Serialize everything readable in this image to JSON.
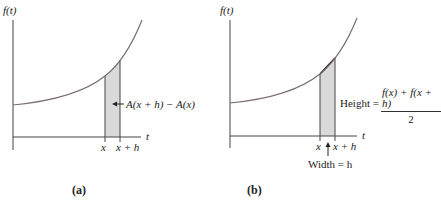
{
  "panels": {
    "a": {
      "y_axis_label": "f(t)",
      "x_axis_label": "t",
      "tick_x": "x",
      "tick_x_plus_h": "x + h",
      "area_label": "A(x + h) − A(x)",
      "caption": "(a)"
    },
    "b": {
      "y_axis_label": "f(t)",
      "x_axis_label": "t",
      "tick_x": "x",
      "tick_x_plus_h": "x + h",
      "height_label": "Height =",
      "height_numerator": "f(x) + f(x + h)",
      "height_denominator": "2",
      "width_label": "Width = h",
      "caption": "(b)"
    }
  },
  "colors": {
    "curve": "#7a6a72",
    "axes": "#444444",
    "shade": "#d9d9d9",
    "strip_edge": "#333333"
  }
}
